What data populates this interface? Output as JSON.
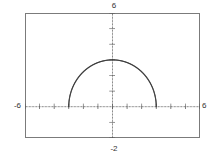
{
  "window": {
    "title": "graphing-calculator-plot"
  },
  "labels": {
    "y_max": "6",
    "y_min": "-2",
    "x_min": "-6",
    "x_max": "6"
  },
  "colors": {
    "frame": "#7b7b7b",
    "axis": "#4a4a4a",
    "curve": "#3a3a3a",
    "label_text": "#333333",
    "background": "#ffffff"
  },
  "chart_data": {
    "type": "line",
    "title": "",
    "xlabel": "",
    "ylabel": "",
    "xlim": [
      -6,
      6
    ],
    "ylim": [
      -2,
      6
    ],
    "grid": false,
    "legend_position": "none",
    "axis_style": "dotted-with-ticks",
    "x_tick_labels": [
      "-6",
      "6"
    ],
    "y_tick_labels": [
      "-2",
      "6"
    ],
    "x_tick_interval": 1,
    "y_tick_interval": 1,
    "curve_style": "dotted",
    "series": [
      {
        "name": "upper semicircle",
        "equation": "y = sqrt(9 - x^2)",
        "center": [
          0,
          0
        ],
        "radius": 3,
        "domain": [
          -3,
          3
        ],
        "range": [
          0,
          3
        ],
        "x": [
          -3.0,
          -2.8,
          -2.6,
          -2.4,
          -2.2,
          -2.0,
          -1.8,
          -1.6,
          -1.4,
          -1.2,
          -1.0,
          -0.8,
          -0.6,
          -0.4,
          -0.2,
          0.0,
          0.2,
          0.4,
          0.6,
          0.8,
          1.0,
          1.2,
          1.4,
          1.6,
          1.8,
          2.0,
          2.2,
          2.4,
          2.6,
          2.8,
          3.0
        ],
        "values": [
          0.0,
          1.077,
          1.497,
          1.8,
          2.04,
          2.236,
          2.4,
          2.537,
          2.653,
          2.75,
          2.828,
          2.891,
          2.939,
          2.973,
          2.993,
          3.0,
          2.993,
          2.973,
          2.939,
          2.891,
          2.828,
          2.75,
          2.653,
          2.537,
          2.4,
          2.236,
          2.04,
          1.8,
          1.497,
          1.077,
          0.0
        ]
      }
    ]
  }
}
